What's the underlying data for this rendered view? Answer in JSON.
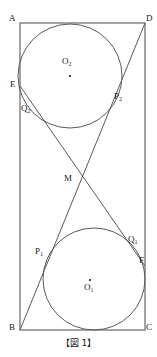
{
  "figure": {
    "caption": "【図 1】",
    "stroke_color": "#4a4a4a",
    "label_color": "#1a1a1a",
    "background_color": "#ffffff",
    "rectangle": {
      "name": "ABCD",
      "left": 20,
      "top": 23,
      "right": 145,
      "bottom": 330
    },
    "vertices": [
      {
        "id": "A",
        "label": "A",
        "x": 20,
        "y": 23,
        "label_x": 9,
        "label_y": 14
      },
      {
        "id": "D",
        "label": "D",
        "x": 145,
        "y": 23,
        "label_x": 146,
        "label_y": 14
      },
      {
        "id": "B",
        "label": "B",
        "x": 20,
        "y": 330,
        "label_x": 9,
        "label_y": 323
      },
      {
        "id": "C",
        "label": "C",
        "x": 145,
        "y": 330,
        "label_x": 146,
        "label_y": 323
      }
    ],
    "circles": [
      {
        "id": "O2",
        "label": "O₂",
        "cx": 70,
        "cy": 76,
        "r": 52,
        "center_dot_x": 70,
        "center_dot_y": 76,
        "label_x": 62,
        "label_y": 62
      },
      {
        "id": "O1",
        "label": "O₁",
        "cx": 94,
        "cy": 279,
        "r": 51,
        "center_dot_x": 90,
        "center_dot_y": 280,
        "label_x": 84,
        "label_y": 285
      }
    ],
    "lines": [
      {
        "id": "BD",
        "from": "B",
        "to": "D",
        "x1": 20,
        "y1": 330,
        "x2": 145,
        "y2": 23
      },
      {
        "id": "EF",
        "from": "E",
        "to": "F",
        "x1": 20,
        "y1": 86,
        "x2": 145,
        "y2": 266
      }
    ],
    "points": [
      {
        "id": "E",
        "label": "E",
        "x": 20,
        "y": 86,
        "label_x": 10,
        "label_y": 82
      },
      {
        "id": "Q2",
        "label": "Q",
        "sub": "2",
        "x": 34,
        "y": 108,
        "label_x": 22,
        "label_y": 108
      },
      {
        "id": "P2",
        "label": "P",
        "sub": "2",
        "x": 113,
        "y": 100,
        "label_x": 114,
        "label_y": 94
      },
      {
        "id": "M",
        "label": "M",
        "x": 83,
        "y": 183,
        "label_x": 65,
        "label_y": 176
      },
      {
        "id": "P1",
        "label": "P",
        "sub": "1",
        "x": 51,
        "y": 254,
        "label_x": 36,
        "label_y": 249
      },
      {
        "id": "Q1",
        "label": "Q",
        "sub": "1",
        "x": 134,
        "y": 249,
        "label_x": 128,
        "label_y": 238
      },
      {
        "id": "F",
        "label": "F",
        "x": 145,
        "y": 266,
        "label_x": 140,
        "label_y": 258
      }
    ]
  }
}
